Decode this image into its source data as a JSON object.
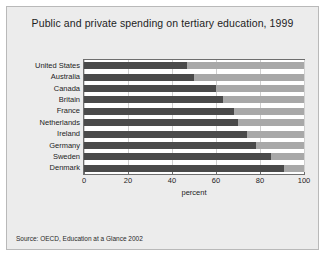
{
  "chart_data": {
    "type": "bar",
    "orientation": "horizontal",
    "stacked": true,
    "title": "Public and private spending on tertiary education, 1999",
    "xlabel": "percent",
    "ylabel": "",
    "xlim": [
      0,
      100
    ],
    "xticks": [
      0,
      20,
      40,
      60,
      80,
      100
    ],
    "grid": true,
    "legend_position": "bottom",
    "categories": [
      "United States",
      "Australia",
      "Canada",
      "Britain",
      "France",
      "Netherlands",
      "Ireland",
      "Germany",
      "Sweden",
      "Denmark"
    ],
    "series": [
      {
        "name": "Public",
        "color": "#4a4a4a",
        "values": [
          47,
          50,
          60,
          63,
          68,
          70,
          74,
          78,
          85,
          91
        ]
      },
      {
        "name": "Private",
        "color": "#a8a8a8",
        "values": [
          53,
          50,
          40,
          37,
          32,
          30,
          26,
          22,
          15,
          9
        ]
      }
    ],
    "source": "Source:  OECD, Education at a Glance 2002"
  },
  "figure": {
    "background_color": "#ececec",
    "plot_background_color": "#ffffff",
    "axis_color": "#6e6e6e",
    "gridline_color": "#cfcfcf"
  }
}
